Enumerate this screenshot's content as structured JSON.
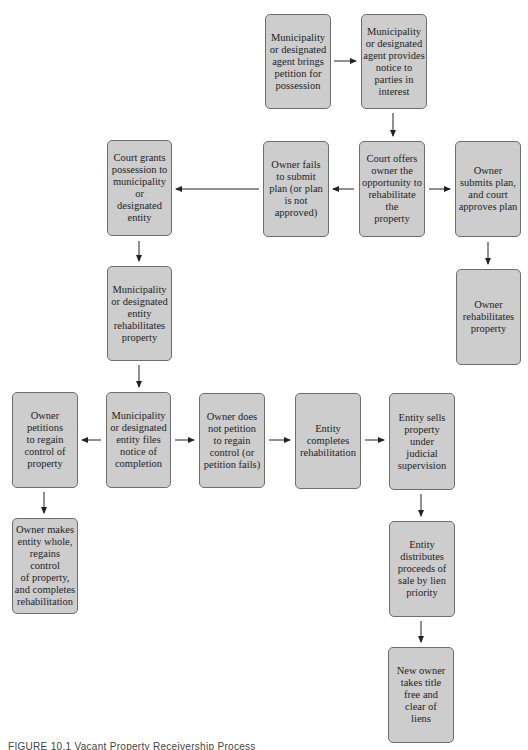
{
  "diagram": {
    "type": "flowchart",
    "colors": {
      "box_fill": "#cdcdcd",
      "box_border": "#6e6e6e",
      "arrow": "#222222",
      "text": "#1e1e1e"
    },
    "nodes": [
      {
        "id": "A",
        "label": "Municipality\nor designated\nagent brings\npetition for\npossession"
      },
      {
        "id": "B",
        "label": "Municipality\nor designated\nagent provides\nnotice to\nparties in\ninterest"
      },
      {
        "id": "C",
        "label": "Court grants\npossession to\nmunicipality or\ndesignated\nentity"
      },
      {
        "id": "D",
        "label": "Owner fails\nto submit\nplan (or plan\nis not\napproved)"
      },
      {
        "id": "E",
        "label": "Court offers\nowner the\nopportunity to\nrehabilitate the\nproperty"
      },
      {
        "id": "F",
        "label": "Owner\nsubmits plan,\nand court\napproves plan"
      },
      {
        "id": "G",
        "label": "Municipality\nor designated\nentity\nrehabilitates\nproperty"
      },
      {
        "id": "H",
        "label": "Owner\nrehabilitates\nproperty"
      },
      {
        "id": "I",
        "label": "Owner\npetitions\nto regain\ncontrol of\nproperty"
      },
      {
        "id": "J",
        "label": "Municipality\nor designated\nentity files\nnotice of\ncompletion"
      },
      {
        "id": "K",
        "label": "Owner does\nnot petition\nto regain\ncontrol (or\npetition fails)"
      },
      {
        "id": "L",
        "label": "Entity\ncompletes\nrehabilitation"
      },
      {
        "id": "M",
        "label": "Entity sells\nproperty\nunder\njudicial\nsupervision"
      },
      {
        "id": "N",
        "label": "Owner makes\nentity whole,\nregains control\nof property,\nand completes\nrehabilitation"
      },
      {
        "id": "O",
        "label": "Entity\ndistributes\nproceeds of\nsale by lien\npriority"
      },
      {
        "id": "P",
        "label": "New owner\ntakes title\nfree and\nclear of\nliens"
      }
    ],
    "edges": [
      [
        "A",
        "B"
      ],
      [
        "B",
        "E"
      ],
      [
        "E",
        "D"
      ],
      [
        "E",
        "F"
      ],
      [
        "D",
        "C"
      ],
      [
        "F",
        "H"
      ],
      [
        "C",
        "G"
      ],
      [
        "G",
        "J"
      ],
      [
        "J",
        "I"
      ],
      [
        "J",
        "K"
      ],
      [
        "I",
        "N"
      ],
      [
        "K",
        "L"
      ],
      [
        "L",
        "M"
      ],
      [
        "M",
        "O"
      ],
      [
        "O",
        "P"
      ]
    ]
  },
  "caption": "FIGURE 10.1  Vacant Property Receivership Process"
}
